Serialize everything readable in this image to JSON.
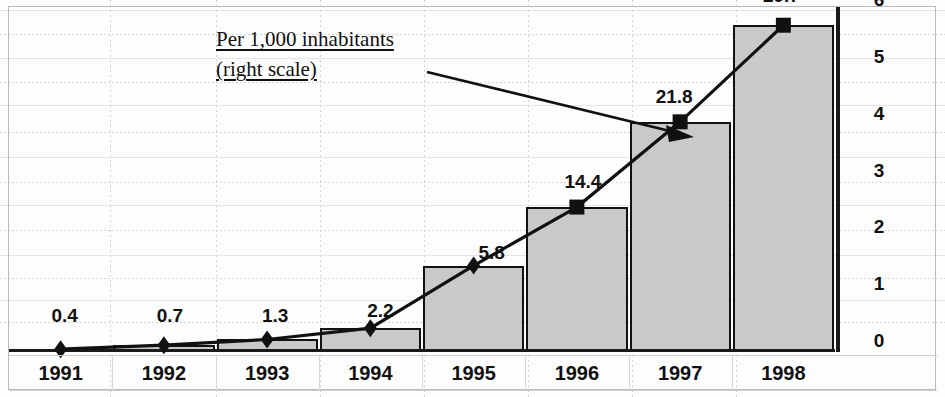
{
  "chart_data": {
    "type": "bar",
    "categories": [
      "1991",
      "1992",
      "1993",
      "1994",
      "1995",
      "1996",
      "1997",
      "1998"
    ],
    "title": "",
    "xlabel": "",
    "ylabel": "",
    "grid": true,
    "legend_position": "inline-annotation",
    "series": [
      {
        "name": "Per 1,000 inhabitants (right scale)",
        "type": "line",
        "axis": "right",
        "values": [
          0.4,
          0.7,
          1.3,
          2.2,
          5.8,
          14.4,
          21.8,
          29.7
        ],
        "value_labels": [
          "0.4",
          "0.7",
          "1.3",
          "2.2",
          "5.8",
          "14.4",
          "21.8",
          "29.7"
        ],
        "marker": "diamond-square",
        "color": "#111111"
      },
      {
        "name": "bars",
        "type": "bar",
        "axis": "left",
        "values": [
          0.05,
          0.12,
          0.22,
          0.42,
          1.52,
          2.55,
          4.05,
          5.75
        ],
        "color": "#c9c9c9"
      }
    ],
    "right_axis": {
      "ticks": [
        "0",
        "1",
        "2",
        "3",
        "4",
        "5",
        "6"
      ],
      "min": 0,
      "max": 6
    }
  },
  "annotation": {
    "line1": "Per 1,000 inhabitants",
    "line2": "(right scale)",
    "arrow_target": "1997 data point"
  }
}
